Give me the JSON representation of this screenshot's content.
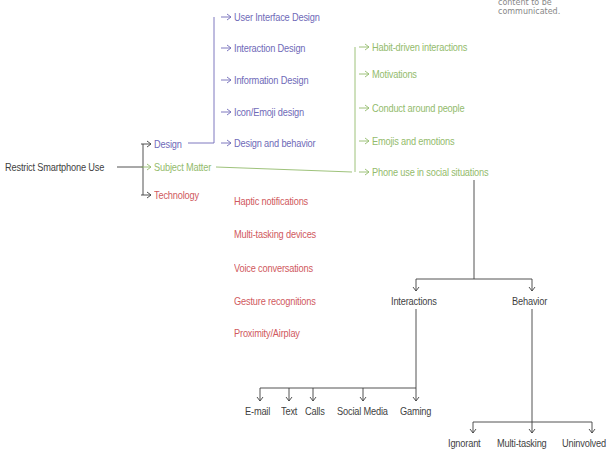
{
  "caption": "content to be communicated.",
  "colors": {
    "dark": "#3f3f3f",
    "design": "#6f6ab8",
    "subject": "#93bb6c",
    "technology": "#d0595e"
  },
  "root": "Restrict Smartphone Use",
  "branches": {
    "design": {
      "label": "Design",
      "children": [
        "User Interface Design",
        "Interaction Design",
        "Information Design",
        "Icon/Emoji design",
        "Design and behavior"
      ]
    },
    "subject": {
      "label": "Subject Matter",
      "children": [
        "Habit-driven interactions",
        "Motivations",
        "Conduct around people",
        "Emojis and emotions",
        "Phone use in social situations"
      ]
    },
    "technology": {
      "label": "Technology",
      "children": [
        "Haptic notifications",
        "Multi-tasking devices",
        "Voice conversations",
        "Gesture recognitions",
        "Proximity/Airplay"
      ]
    }
  },
  "social": {
    "interactions": {
      "label": "Interactions",
      "children": [
        "E-mail",
        "Text",
        "Calls",
        "Social Media",
        "Gaming"
      ]
    },
    "behavior": {
      "label": "Behavior",
      "children": [
        "Ignorant",
        "Multi-tasking",
        "Uninvolved"
      ]
    }
  }
}
